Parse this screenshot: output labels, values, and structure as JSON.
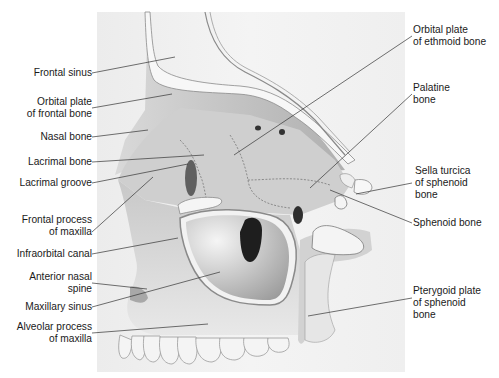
{
  "figure": {
    "colors": {
      "background": "#ffffff",
      "panel": "#efefef",
      "bone_light": "#e6e6e6",
      "bone_mid": "#bdbdbd",
      "bone_dark": "#7a7a7a",
      "cut_surface": "#f7f7f7",
      "leader_line": "#333333",
      "text": "#1a1a1a"
    }
  },
  "labels_left": [
    {
      "id": "frontal-sinus",
      "lines": [
        "Frontal sinus"
      ]
    },
    {
      "id": "orbital-plate-frontal",
      "lines": [
        "Orbital plate",
        "of frontal bone"
      ]
    },
    {
      "id": "nasal-bone",
      "lines": [
        "Nasal bone"
      ]
    },
    {
      "id": "lacrimal-bone",
      "lines": [
        "Lacrimal bone"
      ]
    },
    {
      "id": "lacrimal-groove",
      "lines": [
        "Lacrimal groove"
      ]
    },
    {
      "id": "frontal-process-maxilla",
      "lines": [
        "Frontal process",
        "of maxilla"
      ]
    },
    {
      "id": "infraorbital-canal",
      "lines": [
        "Infraorbital canal"
      ]
    },
    {
      "id": "anterior-nasal-spine",
      "lines": [
        "Anterior nasal",
        "spine"
      ]
    },
    {
      "id": "maxillary-sinus",
      "lines": [
        "Maxillary sinus"
      ]
    },
    {
      "id": "alveolar-process-maxilla",
      "lines": [
        "Alveolar process",
        "of maxilla"
      ]
    }
  ],
  "labels_right": [
    {
      "id": "orbital-plate-ethmoid",
      "lines": [
        "Orbital plate",
        "of ethmoid bone"
      ]
    },
    {
      "id": "palatine-bone",
      "lines": [
        "Palatine",
        "bone"
      ]
    },
    {
      "id": "sella-turcica",
      "lines": [
        "Sella turcica",
        "of sphenoid",
        "bone"
      ]
    },
    {
      "id": "sphenoid-bone",
      "lines": [
        "Sphenoid bone"
      ]
    },
    {
      "id": "pterygoid-plate",
      "lines": [
        "Pterygoid plate",
        "of sphenoid",
        "bone"
      ]
    }
  ]
}
